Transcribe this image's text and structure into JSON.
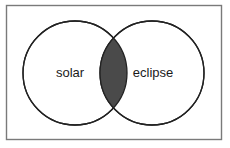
{
  "figure": {
    "type": "venn-diagram",
    "background_color": "#ffffff",
    "frame": {
      "present": true,
      "stroke_color": "#7a7a7a",
      "fill_color": "#ffffff",
      "x": 6,
      "y": 5,
      "width": 216,
      "height": 135
    },
    "circle_stroke_color": "#222222",
    "circle_fill_color": "#ffffff",
    "intersection_fill_color": "#4a4a4a",
    "label_color": "#1a1a1a",
    "sets": [
      {
        "id": "left",
        "label": "solar",
        "cx": 75,
        "cy": 73,
        "r": 52,
        "label_x": 70,
        "label_y": 73
      },
      {
        "id": "right",
        "label": "eclipse",
        "cx": 152,
        "cy": 73,
        "r": 52,
        "label_x": 153,
        "label_y": 73
      }
    ],
    "intersection": {
      "label": "",
      "shaded": true
    }
  }
}
